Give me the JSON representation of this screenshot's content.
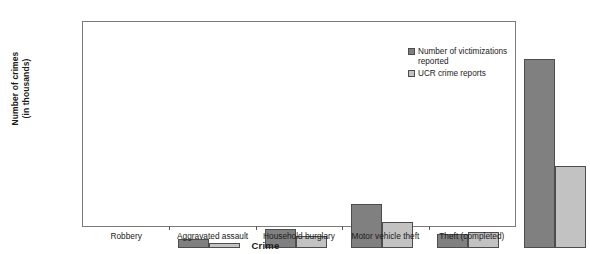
{
  "chart_data": {
    "type": "bar",
    "title": "",
    "xlabel": "Crime",
    "ylabel": "Number of crimes\n(in thousands)",
    "categories": [
      "Robbery",
      "Aggravated assault",
      "Household burglary",
      "Motor vehicle theft",
      "Theft (completed)"
    ],
    "series": [
      {
        "name": "Number of victimizations\nreported",
        "color": "#808080",
        "values": [
          800,
          1600,
          3800,
          1200,
          16200
        ]
      },
      {
        "name": "UCR crime reports",
        "color": "#c2c2c2",
        "values": [
          400,
          1000,
          2200,
          1400,
          7000
        ]
      }
    ],
    "ylim": [
      0,
      17500
    ],
    "yticks": [
      0,
      1500,
      3000,
      4500,
      6000,
      7500,
      9000,
      10500,
      12000,
      13500,
      15000,
      16500
    ],
    "ytick_labels": [
      "0",
      "1500",
      "3000",
      "4500",
      "6000",
      "7500",
      "9000",
      "10500",
      "12000",
      "13500",
      "15000",
      "16500"
    ],
    "grid": false,
    "legend_position": "top-right"
  }
}
